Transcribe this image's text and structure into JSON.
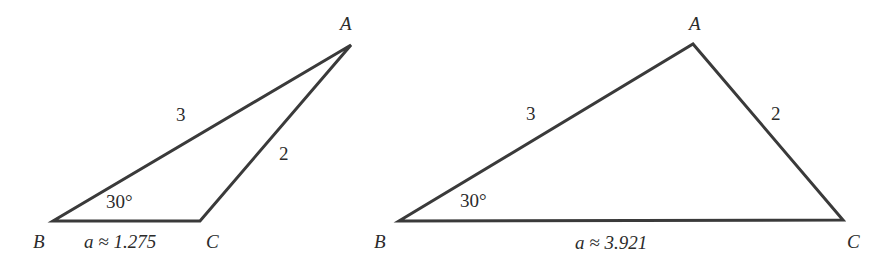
{
  "figure": {
    "triangles": [
      {
        "id": "left",
        "vertices": {
          "A": {
            "label": "A",
            "x": 351,
            "y": 45
          },
          "B": {
            "label": "B",
            "x": 53,
            "y": 221
          },
          "C": {
            "label": "C",
            "x": 200,
            "y": 221
          }
        },
        "labels": {
          "side_c": "3",
          "side_b": "2",
          "angle_B": "30°",
          "side_a": "a ≈ 1.275"
        }
      },
      {
        "id": "right",
        "vertices": {
          "A": {
            "label": "A",
            "x": 693,
            "y": 44
          },
          "B": {
            "label": "B",
            "x": 399,
            "y": 221
          },
          "C": {
            "label": "C",
            "x": 843,
            "y": 220
          }
        },
        "labels": {
          "side_c": "3",
          "side_b": "2",
          "angle_B": "30°",
          "side_a": "a ≈ 3.921"
        }
      }
    ],
    "colors": {
      "stroke": "#3a3a3a",
      "text": "#2b2b2b",
      "background": "#ffffff"
    }
  }
}
